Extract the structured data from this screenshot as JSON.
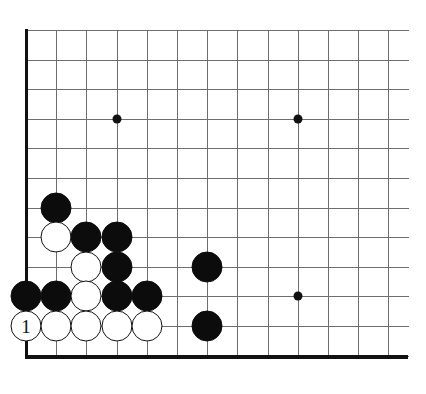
{
  "diagram": {
    "kind": "go-board-corner-diagram",
    "colors": {
      "background": "#ffffff",
      "grid_line": "#6e6e6e",
      "border_line": "#111111",
      "black_stone": "#0c0c0c",
      "white_stone": "#ffffff",
      "star_point": "#111111"
    },
    "geometry": {
      "origin_x": 26,
      "origin_y": 30,
      "col_spacing": 30.2,
      "row_spacing": 29.6,
      "columns": 13,
      "rows": 12,
      "stone_diameter": 31
    },
    "borders": [
      {
        "name": "left-edge",
        "orientation": "vertical"
      },
      {
        "name": "bottom-edge",
        "orientation": "horizontal"
      }
    ],
    "star_points": [
      {
        "col": 3,
        "row": 3
      },
      {
        "col": 9,
        "row": 3
      },
      {
        "col": 9,
        "row": 9
      }
    ],
    "stones": [
      {
        "color": "black",
        "col": 1,
        "row": 6,
        "label": ""
      },
      {
        "color": "white",
        "col": 1,
        "row": 7,
        "label": ""
      },
      {
        "color": "black",
        "col": 2,
        "row": 7,
        "label": ""
      },
      {
        "color": "black",
        "col": 3,
        "row": 7,
        "label": ""
      },
      {
        "color": "white",
        "col": 2,
        "row": 8,
        "label": ""
      },
      {
        "color": "black",
        "col": 3,
        "row": 8,
        "label": ""
      },
      {
        "color": "black",
        "col": 6,
        "row": 8,
        "label": ""
      },
      {
        "color": "black",
        "col": 0,
        "row": 9,
        "label": ""
      },
      {
        "color": "black",
        "col": 1,
        "row": 9,
        "label": ""
      },
      {
        "color": "white",
        "col": 2,
        "row": 9,
        "label": ""
      },
      {
        "color": "black",
        "col": 3,
        "row": 9,
        "label": ""
      },
      {
        "color": "black",
        "col": 4,
        "row": 9,
        "label": ""
      },
      {
        "color": "white",
        "col": 0,
        "row": 10,
        "label": "1"
      },
      {
        "color": "white",
        "col": 1,
        "row": 10,
        "label": ""
      },
      {
        "color": "white",
        "col": 2,
        "row": 10,
        "label": ""
      },
      {
        "color": "white",
        "col": 3,
        "row": 10,
        "label": ""
      },
      {
        "color": "white",
        "col": 4,
        "row": 10,
        "label": ""
      },
      {
        "color": "black",
        "col": 6,
        "row": 10,
        "label": ""
      }
    ]
  }
}
